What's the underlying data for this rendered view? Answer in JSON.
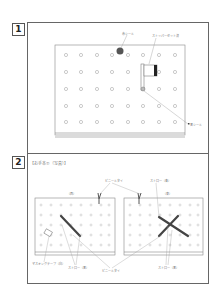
{
  "panels": [
    {
      "number": "1",
      "labels": {
        "red_seal": "赤シール",
        "stopper_set": "ストッパーセット済",
        "black_seal": "黒シール"
      }
    },
    {
      "number": "2",
      "title": "【お手本①（写真）】",
      "labels": {
        "west": "（西）",
        "east": "（東）",
        "vinyl_tie": "ビニールタイ",
        "straw_blue_top": "ストロー（青）",
        "straw_black_left": "ストロー（黒）",
        "vinyl_tie_bottom": "ビニールタイ",
        "straw_black_right": "ストロー（黒）",
        "masking_tape": "マスキングテープ（白）"
      }
    }
  ],
  "colors": {
    "frame": "#666666",
    "board": "#888888",
    "hole": "#999999",
    "red_seal": "#555555",
    "straw": "#444444"
  }
}
